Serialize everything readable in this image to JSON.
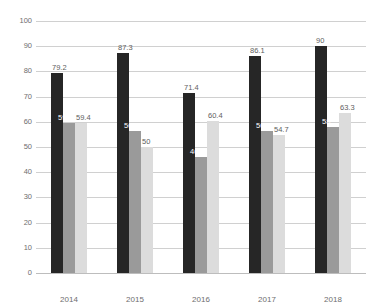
{
  "chart_data": {
    "type": "bar",
    "title": "",
    "subtitle": "",
    "xlabel": "",
    "ylabel": "",
    "categories": [
      "2014",
      "2015",
      "2016",
      "2017",
      "2018"
    ],
    "series": [
      {
        "name": "Series 1",
        "color": "#262626",
        "values": [
          79.2,
          87.3,
          71.4,
          86.1,
          90
        ]
      },
      {
        "name": "Series 2",
        "color": "#9a9a9a",
        "values": [
          59.4,
          56.3,
          46,
          56.5,
          58
        ]
      },
      {
        "name": "Series 3",
        "color": "#dcdcdc",
        "values": [
          59.4,
          50,
          60.4,
          54.7,
          63.3
        ]
      }
    ],
    "ylim": [
      0,
      100
    ],
    "ytick_step": 10,
    "ytick_labels": [
      "100",
      "90",
      "80",
      "70",
      "60",
      "50",
      "40",
      "30",
      "20",
      "10",
      "0"
    ],
    "grid": true,
    "grid_axis": "y",
    "legend": false,
    "legend_position": "none",
    "data_labels": true,
    "data_label_values": [
      [
        "79.2",
        "59.4",
        "59.4"
      ],
      [
        "87.3",
        "56.3",
        "50"
      ],
      [
        "71.4",
        "46",
        "60.4"
      ],
      [
        "86.1",
        "56.5",
        "54.7"
      ],
      [
        "90",
        "58",
        "63.3"
      ]
    ],
    "annotations": [],
    "background_color": "#ffffff",
    "gridline_color": "#d0d0d0",
    "tick_label_color": "#6e6e6e"
  }
}
